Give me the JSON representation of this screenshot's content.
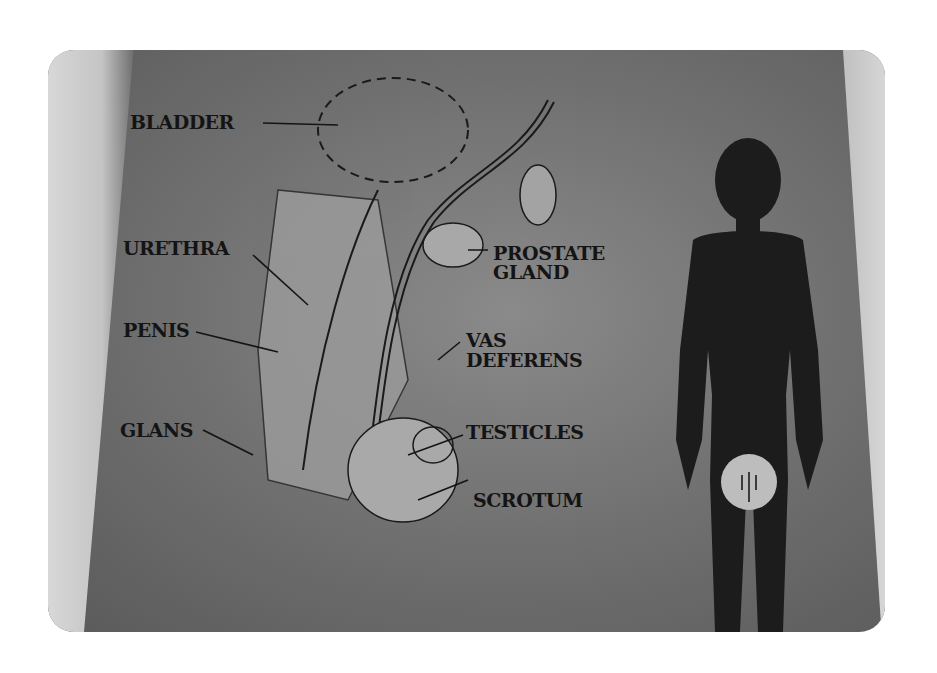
{
  "diagram": {
    "labels": {
      "bladder": "BLADDER",
      "urethra": "URETHRA",
      "penis": "PENIS",
      "glans": "GLANS",
      "prostate_line1": "PROSTATE",
      "prostate_line2": "GLAND",
      "vas_line1": "VAS",
      "vas_line2": "DEFERENS",
      "testicles": "TESTICLES",
      "scrotum": "SCROTUM"
    },
    "colors": {
      "background": "#6e6e6e",
      "silhouette": "#1c1c1c",
      "highlight_circle": "#bdbdbd",
      "label_text": "#141414"
    }
  }
}
